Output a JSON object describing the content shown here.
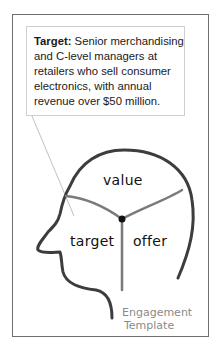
{
  "callout": {
    "label": "Target:",
    "text": " Senior merchandising and C-level managers at retailers who sell consumer electronics, with annual revenue over $50 million."
  },
  "diagram": {
    "sections": {
      "top": "value",
      "left": "target",
      "right": "offer"
    },
    "caption_line1": "Engagement",
    "caption_line2": "Template",
    "colors": {
      "outline": "#3d3d3d",
      "dividers": "#7a7a7a",
      "caption": "#8a8a8a",
      "frame": "#6f6f6f"
    }
  }
}
